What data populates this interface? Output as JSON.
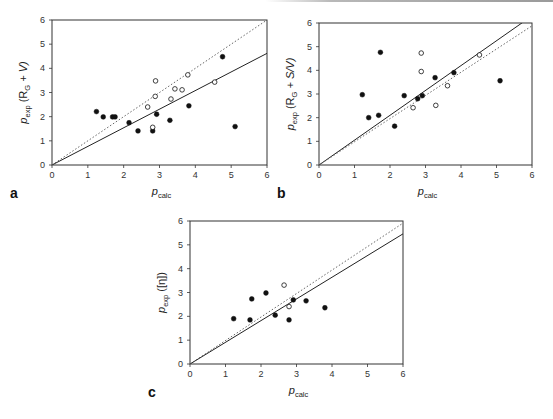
{
  "figure": {
    "panels": [
      "a",
      "b",
      "c"
    ]
  },
  "chart_data": [
    {
      "id": "a",
      "type": "scatter",
      "panel_label": "a",
      "title": "",
      "xlabel": "p_calc",
      "ylabel": "p_exp (R_G + V)",
      "xlabel_main": "p",
      "xlabel_sub": "calc",
      "ylabel_main": "p",
      "ylabel_sub": "exp",
      "ylabel_rest": " (R",
      "ylabel_rest_sub": "G",
      "ylabel_tail": " + V)",
      "xlim": [
        0,
        6
      ],
      "ylim": [
        0,
        6
      ],
      "xticks": [
        0,
        1,
        2,
        3,
        4,
        5,
        6
      ],
      "yticks": [
        0,
        1,
        2,
        3,
        4,
        5,
        6
      ],
      "grid": false,
      "box": [
        52,
        20,
        267,
        165
      ],
      "series": [
        {
          "name": "filled",
          "marker": "filled-circle",
          "points": [
            [
              1.24,
              2.21
            ],
            [
              1.43,
              1.99
            ],
            [
              1.69,
              1.99
            ],
            [
              1.76,
              1.99
            ],
            [
              2.15,
              1.75
            ],
            [
              2.4,
              1.41
            ],
            [
              2.81,
              1.41
            ],
            [
              2.92,
              2.1
            ],
            [
              3.29,
              1.85
            ],
            [
              3.82,
              2.45
            ],
            [
              4.76,
              4.48
            ],
            [
              5.11,
              1.59
            ]
          ]
        },
        {
          "name": "open",
          "marker": "open-circle",
          "points": [
            [
              2.89,
              3.48
            ],
            [
              2.88,
              2.84
            ],
            [
              2.67,
              2.4
            ],
            [
              2.81,
              1.56
            ],
            [
              3.32,
              2.73
            ],
            [
              3.43,
              3.15
            ],
            [
              3.63,
              3.11
            ],
            [
              3.79,
              3.73
            ],
            [
              4.54,
              3.43
            ]
          ]
        }
      ],
      "lines": [
        {
          "name": "fit",
          "style": "solid",
          "slope": 0.77
        },
        {
          "name": "identity",
          "style": "dotted",
          "slope": 1.0
        }
      ]
    },
    {
      "id": "b",
      "type": "scatter",
      "panel_label": "b",
      "title": "",
      "xlabel": "p_calc",
      "ylabel": "p_exp (R_G + S/V)",
      "xlabel_main": "p",
      "xlabel_sub": "calc",
      "ylabel_main": "p",
      "ylabel_sub": "exp",
      "ylabel_rest": " (R",
      "ylabel_rest_sub": "G",
      "ylabel_tail": " + S/V)",
      "xlim": [
        0,
        6
      ],
      "ylim": [
        0,
        6
      ],
      "xticks": [
        0,
        1,
        2,
        3,
        4,
        5,
        6
      ],
      "yticks": [
        0,
        1,
        2,
        3,
        4,
        5,
        6
      ],
      "grid": false,
      "box": [
        319,
        23,
        532,
        165
      ],
      "series": [
        {
          "name": "filled",
          "marker": "filled-circle",
          "points": [
            [
              1.22,
              2.97
            ],
            [
              1.4,
              2.0
            ],
            [
              1.68,
              2.1
            ],
            [
              1.73,
              4.76
            ],
            [
              2.13,
              1.64
            ],
            [
              2.4,
              2.93
            ],
            [
              2.78,
              2.8
            ],
            [
              2.91,
              2.93
            ],
            [
              3.27,
              3.69
            ],
            [
              3.8,
              3.9
            ],
            [
              5.1,
              3.56
            ]
          ]
        },
        {
          "name": "open",
          "marker": "open-circle",
          "points": [
            [
              2.88,
              4.73
            ],
            [
              2.88,
              3.95
            ],
            [
              2.65,
              2.42
            ],
            [
              3.29,
              2.52
            ],
            [
              3.62,
              3.35
            ],
            [
              4.52,
              4.65
            ]
          ]
        }
      ],
      "lines": [
        {
          "name": "fit",
          "style": "solid",
          "slope": 1.05
        },
        {
          "name": "identity",
          "style": "dotted",
          "slope": 0.98
        }
      ]
    },
    {
      "id": "c",
      "type": "scatter",
      "panel_label": "c",
      "title": "",
      "xlabel": "p_calc",
      "ylabel": "p_exp ([η])",
      "xlabel_main": "p",
      "xlabel_sub": "calc",
      "ylabel_main": "p",
      "ylabel_sub": "exp",
      "ylabel_rest": " ([η])",
      "ylabel_rest_sub": "",
      "ylabel_tail": "",
      "xlim": [
        0,
        6
      ],
      "ylim": [
        0,
        6
      ],
      "xticks": [
        0,
        1,
        2,
        3,
        4,
        5,
        6
      ],
      "yticks": [
        0,
        1,
        2,
        3,
        4,
        5,
        6
      ],
      "grid": false,
      "box": [
        190,
        221,
        403,
        364
      ],
      "series": [
        {
          "name": "filled",
          "marker": "filled-circle",
          "points": [
            [
              1.23,
              1.9
            ],
            [
              1.69,
              1.85
            ],
            [
              1.74,
              2.73
            ],
            [
              2.14,
              2.98
            ],
            [
              2.4,
              2.05
            ],
            [
              2.79,
              1.85
            ],
            [
              2.91,
              2.69
            ],
            [
              3.27,
              2.65
            ],
            [
              3.8,
              2.36
            ]
          ]
        },
        {
          "name": "open",
          "marker": "open-circle",
          "points": [
            [
              2.65,
              3.31
            ],
            [
              2.79,
              2.41
            ]
          ]
        }
      ],
      "lines": [
        {
          "name": "fit",
          "style": "solid",
          "slope": 0.91
        },
        {
          "name": "identity",
          "style": "dotted",
          "slope": 0.985
        }
      ]
    }
  ]
}
